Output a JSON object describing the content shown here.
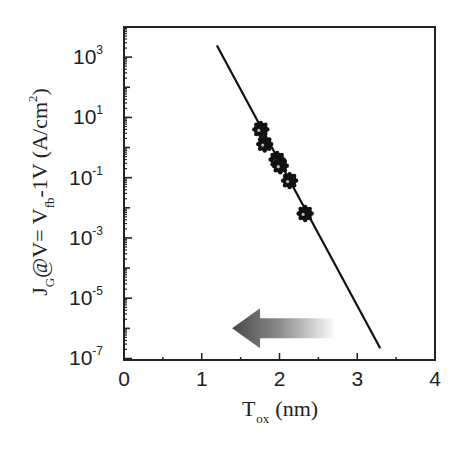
{
  "chart_data": {
    "type": "scatter",
    "title": "",
    "xlabel": "T_ox (nm)",
    "xlabel_main": "T",
    "xlabel_sub": "ox",
    "xlabel_unit": "(nm)",
    "ylabel": "J_G@V= V_fb-1V (A/cm^2)",
    "ylabel_parts": {
      "j": "J",
      "j_sub": "G",
      "mid": "@V= V",
      "v_sub": "fb",
      "tail": "-1V (A/cm",
      "sup": "2",
      "close": ")"
    },
    "xlim": [
      0,
      4
    ],
    "ylim_log10": [
      -7.05,
      4.0
    ],
    "yscale": "log",
    "x_ticks": [
      0,
      1,
      2,
      3,
      4
    ],
    "x_tick_labels": [
      "0",
      "1",
      "2",
      "3",
      "4"
    ],
    "y_ticks_log10": [
      3,
      1,
      -1,
      -3,
      -5,
      -7
    ],
    "y_tick_labels": [
      "10^3",
      "10^1",
      "10^-1",
      "10^-3",
      "10^-5",
      "10^-7"
    ],
    "grid": false,
    "legend": null,
    "series": [
      {
        "name": "measured",
        "type": "scatter",
        "marker": "filled-circle",
        "x": [
          1.76,
          1.81,
          1.97,
          2.01,
          2.13,
          2.33
        ],
        "y": [
          4.0,
          1.3,
          0.4,
          0.25,
          0.08,
          0.0065
        ]
      },
      {
        "name": "fit",
        "type": "line",
        "x": [
          1.2,
          3.29
        ],
        "y": [
          2300,
          2.3e-07
        ]
      }
    ],
    "annotations": [
      {
        "type": "arrow",
        "direction": "left",
        "gradient": [
          "#4a4a4a",
          "#ffffff"
        ],
        "x_range_nm": [
          1.39,
          2.73
        ],
        "y_log10": -6.0,
        "meaning": "scaling direction (thinner oxide)"
      }
    ]
  },
  "colors": {
    "axis": "#222222",
    "line": "#111111",
    "marker": "#111111",
    "arrow_dark": "#4a4a4a",
    "arrow_light": "#ffffff"
  }
}
